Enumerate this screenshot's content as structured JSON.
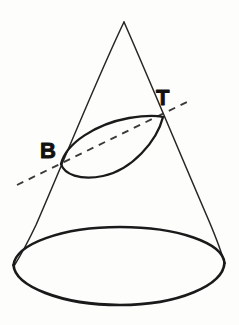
{
  "figure": {
    "background_color": "#fdfdfc",
    "ink_color": "#1a1a1a",
    "width": 239,
    "height": 325
  },
  "labels": {
    "b": {
      "text": "B",
      "x": 40,
      "y": 158,
      "font_size": 22
    },
    "t": {
      "text": "T",
      "x": 156,
      "y": 105,
      "font_size": 22
    }
  },
  "geometry": {
    "apex": {
      "x": 124,
      "y": 22
    },
    "base_ellipse": {
      "cx": 119,
      "cy": 266,
      "rx": 106,
      "ry": 39,
      "rotation_deg": -1.2,
      "stroke_width": 2.6
    },
    "left_generator": {
      "x1": 124,
      "y1": 22,
      "x2": 14,
      "y2": 266
    },
    "right_generator": {
      "x1": 124,
      "y1": 22,
      "x2": 224,
      "y2": 262
    },
    "section_ellipse": {
      "cx": 112,
      "cy": 140,
      "rx": 57,
      "ry": 16,
      "rotation_deg": -24.5,
      "stroke_width": 2.2,
      "point_b": {
        "x": 61,
        "y": 164
      },
      "point_t": {
        "x": 163,
        "y": 117
      }
    },
    "dashed_axis": {
      "x1": 17,
      "y1": 185,
      "x2": 191,
      "y2": 100,
      "dash_pattern": "7 6",
      "stroke_width": 1.9
    }
  }
}
